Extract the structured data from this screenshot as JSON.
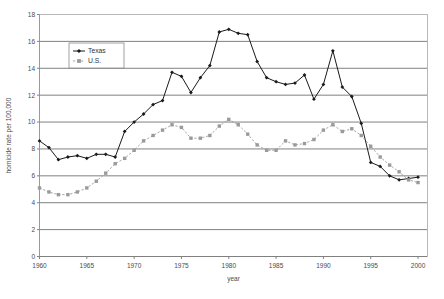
{
  "chart_data": {
    "type": "line",
    "title": "",
    "xlabel": "year",
    "ylabel": "homicide rate per 100,000",
    "xlim": [
      1960,
      2001
    ],
    "ylim": [
      0,
      18
    ],
    "xticks": [
      1960,
      1965,
      1970,
      1975,
      1980,
      1985,
      1990,
      1995,
      2000
    ],
    "yticks": [
      0,
      2,
      4,
      6,
      8,
      10,
      12,
      14,
      16,
      18
    ],
    "grid": "horizontal",
    "legend_position": "upper-left-inside",
    "x": [
      1960,
      1961,
      1962,
      1963,
      1964,
      1965,
      1966,
      1967,
      1968,
      1969,
      1970,
      1971,
      1972,
      1973,
      1974,
      1975,
      1976,
      1977,
      1978,
      1979,
      1980,
      1981,
      1982,
      1983,
      1984,
      1985,
      1986,
      1987,
      1988,
      1989,
      1990,
      1991,
      1992,
      1993,
      1994,
      1995,
      1996,
      1997,
      1998,
      1999,
      2000
    ],
    "series": [
      {
        "name": "Texas",
        "marker": "diamond",
        "color": "#1a1a1a",
        "values": [
          8.6,
          8.1,
          7.2,
          7.4,
          7.5,
          7.3,
          7.6,
          7.6,
          7.4,
          9.3,
          10.0,
          10.6,
          11.3,
          11.6,
          13.7,
          13.4,
          12.2,
          13.3,
          14.2,
          16.7,
          16.9,
          16.6,
          16.5,
          14.5,
          13.3,
          13.0,
          12.8,
          12.9,
          13.5,
          11.7,
          12.8,
          15.3,
          12.6,
          11.9,
          9.9,
          7.0,
          6.7,
          6.0,
          5.7,
          5.8,
          5.9
        ]
      },
      {
        "name": "U.S.",
        "marker": "square",
        "color": "#9a9a9a",
        "values": [
          5.1,
          4.8,
          4.6,
          4.6,
          4.8,
          5.1,
          5.6,
          6.2,
          6.9,
          7.3,
          7.9,
          8.6,
          9.0,
          9.4,
          9.8,
          9.6,
          8.8,
          8.8,
          9.0,
          9.7,
          10.2,
          9.8,
          9.1,
          8.3,
          7.9,
          7.9,
          8.6,
          8.3,
          8.4,
          8.7,
          9.4,
          9.8,
          9.3,
          9.5,
          9.0,
          8.2,
          7.4,
          6.8,
          6.3,
          5.7,
          5.5
        ]
      }
    ]
  },
  "axis": {
    "ylabel": "homicide rate per 100,000",
    "xlabel": "year",
    "yticks": [
      "0",
      "2",
      "4",
      "6",
      "8",
      "10",
      "12",
      "14",
      "16",
      "18"
    ],
    "xticks": [
      "1960",
      "1965",
      "1970",
      "1975",
      "1980",
      "1985",
      "1990",
      "1995",
      "2000"
    ]
  },
  "legend": {
    "entries": [
      {
        "label": "Texas",
        "marker": "diamond-marker-icon"
      },
      {
        "label": "U.S.",
        "marker": "square-marker-icon"
      }
    ]
  }
}
